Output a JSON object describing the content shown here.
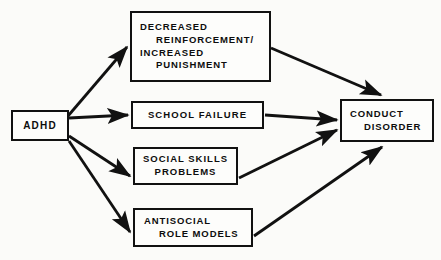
{
  "diagram": {
    "background_color": "#fbfbf9",
    "stroke_color": "#111111",
    "text_color": "#0d0d0d",
    "nodes": [
      {
        "id": "adhd",
        "name": "adhd",
        "lines": [
          "ADHD"
        ],
        "role": "source"
      },
      {
        "id": "reinforcement",
        "name": "decreased-reinforcement-increased-punishment",
        "lines": [
          "DECREASED",
          "REINFORCEMENT/",
          "INCREASED",
          "PUNISHMENT"
        ],
        "role": "mediator"
      },
      {
        "id": "school",
        "name": "school-failure",
        "lines": [
          "SCHOOL FAILURE"
        ],
        "role": "mediator"
      },
      {
        "id": "social",
        "name": "social-skills-problems",
        "lines": [
          "SOCIAL SKILLS",
          "PROBLEMS"
        ],
        "role": "mediator"
      },
      {
        "id": "antisocial",
        "name": "antisocial-role-models",
        "lines": [
          "ANTISOCIAL",
          "ROLE MODELS"
        ],
        "role": "mediator"
      },
      {
        "id": "conduct",
        "name": "conduct-disorder",
        "lines": [
          "CONDUCT",
          "DISORDER"
        ],
        "role": "outcome"
      }
    ],
    "edges": [
      {
        "from": "adhd",
        "to": "reinforcement"
      },
      {
        "from": "adhd",
        "to": "school"
      },
      {
        "from": "adhd",
        "to": "social"
      },
      {
        "from": "adhd",
        "to": "antisocial"
      },
      {
        "from": "reinforcement",
        "to": "conduct"
      },
      {
        "from": "school",
        "to": "conduct"
      },
      {
        "from": "social",
        "to": "conduct"
      },
      {
        "from": "antisocial",
        "to": "conduct"
      }
    ]
  }
}
